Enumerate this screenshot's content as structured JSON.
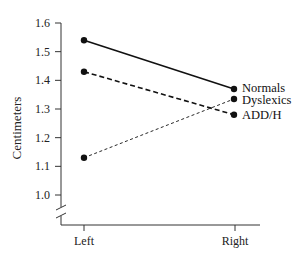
{
  "chart_data": {
    "type": "line",
    "title": "",
    "xlabel": "",
    "ylabel": "Centimeters",
    "categories": [
      "Left",
      "Right"
    ],
    "yticks": [
      "1.0",
      "1.1",
      "1.2",
      "1.3",
      "1.4",
      "1.5",
      "1.6"
    ],
    "ylim": [
      1.0,
      1.6
    ],
    "axis_break": true,
    "grid": false,
    "legend_position": "inline-right",
    "series": [
      {
        "name": "Normals",
        "values": [
          1.54,
          1.37
        ],
        "line_style": "solid",
        "line_width": 1.6
      },
      {
        "name": "Dyslexics",
        "values": [
          1.13,
          1.335
        ],
        "line_style": "dashed-fine",
        "line_width": 0.9
      },
      {
        "name": "ADD/H",
        "values": [
          1.43,
          1.28
        ],
        "line_style": "dashed",
        "line_width": 1.6
      }
    ]
  }
}
